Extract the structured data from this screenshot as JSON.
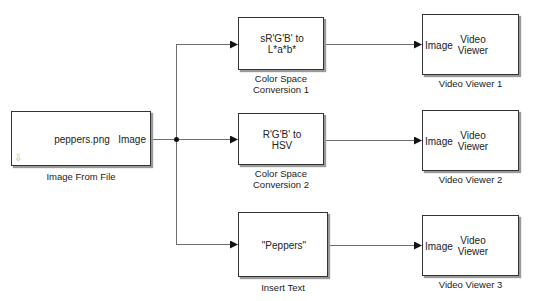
{
  "diagram": {
    "type": "simulink-model",
    "colors": {
      "wire": "#6e6e6e",
      "block_border": "#333333",
      "shadow": "#9a9a9a",
      "background": "#ffffff"
    },
    "source": {
      "name": "Image From File",
      "content": "peppers.png",
      "output_port": "Image",
      "icon": "down-arrow-icon"
    },
    "conversions": [
      {
        "name_line1": "Color Space",
        "name_line2": "Conversion 1",
        "line1": "sR'G'B' to",
        "line2": "L*a*b*"
      },
      {
        "name_line1": "Color Space",
        "name_line2": "Conversion 2",
        "line1": "R'G'B' to",
        "line2": "HSV"
      }
    ],
    "insert_text": {
      "name": "Insert Text",
      "content": "\"Peppers\""
    },
    "viewers": [
      {
        "name": "Video Viewer 1",
        "input_port": "Image",
        "line1": "Video",
        "line2": "Viewer"
      },
      {
        "name": "Video Viewer 2",
        "input_port": "Image",
        "line1": "Video",
        "line2": "Viewer"
      },
      {
        "name": "Video Viewer 3",
        "input_port": "Image",
        "line1": "Video",
        "line2": "Viewer"
      }
    ],
    "connections": [
      {
        "from": "Image From File",
        "to": "Color Space Conversion 1"
      },
      {
        "from": "Image From File",
        "to": "Color Space Conversion 2"
      },
      {
        "from": "Image From File",
        "to": "Insert Text"
      },
      {
        "from": "Color Space Conversion 1",
        "to": "Video Viewer 1"
      },
      {
        "from": "Color Space Conversion 2",
        "to": "Video Viewer 2"
      },
      {
        "from": "Insert Text",
        "to": "Video Viewer 3"
      }
    ]
  }
}
